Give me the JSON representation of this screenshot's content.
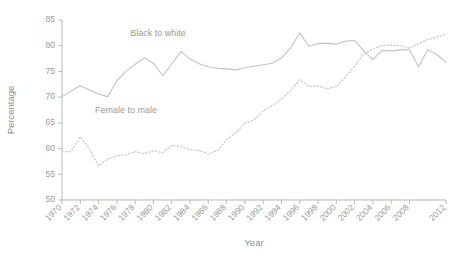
{
  "chart_data": {
    "type": "line",
    "title": "",
    "xlabel": "Year",
    "ylabel": "Percentage",
    "xlim": [
      1970,
      2012
    ],
    "ylim": [
      50,
      85
    ],
    "yticks": [
      50,
      55,
      60,
      65,
      70,
      75,
      80,
      85
    ],
    "xticks": [
      1970,
      1972,
      1974,
      1976,
      1978,
      1980,
      1982,
      1984,
      1986,
      1988,
      1990,
      1992,
      1994,
      1996,
      1998,
      2000,
      2002,
      2004,
      2006,
      2008,
      2012
    ],
    "xtick_labels": [
      "1970",
      "1972",
      "1974",
      "1976",
      "1978",
      "1980",
      "1982",
      "1984",
      "1986",
      "1988",
      "1990",
      "1992",
      "1994",
      "1996",
      "1998",
      "2000",
      "2002",
      "2004",
      "2006",
      "2008",
      "2012"
    ],
    "grid": false,
    "legend_position": "inline-annotation",
    "x": [
      1970,
      1971,
      1972,
      1973,
      1974,
      1975,
      1976,
      1977,
      1978,
      1979,
      1980,
      1981,
      1982,
      1983,
      1984,
      1985,
      1986,
      1987,
      1988,
      1989,
      1990,
      1991,
      1992,
      1993,
      1994,
      1995,
      1996,
      1997,
      1998,
      1999,
      2000,
      2001,
      2002,
      2003,
      2004,
      2005,
      2006,
      2007,
      2008,
      2009,
      2010,
      2011,
      2012
    ],
    "series": [
      {
        "name": "Black to white",
        "style": "solid",
        "color": "#c3c3c3",
        "label_x": 1980.5,
        "label_y": 81.8,
        "values": [
          70.1,
          71.2,
          72.2,
          71.4,
          70.6,
          70.1,
          73.2,
          75.0,
          76.4,
          77.6,
          76.6,
          74.2,
          76.4,
          78.9,
          77.4,
          76.5,
          75.9,
          75.6,
          75.5,
          75.3,
          75.7,
          76.0,
          76.3,
          76.6,
          77.6,
          79.6,
          82.5,
          79.9,
          80.4,
          80.5,
          80.3,
          80.9,
          81.0,
          79.0,
          77.3,
          79.1,
          79.0,
          79.2,
          79.2,
          75.9,
          79.2,
          78.3,
          76.8
        ]
      },
      {
        "name": "Female to male",
        "style": "dotted",
        "color": "#c9c9c9",
        "label_x": 1977.0,
        "label_y": 66.9,
        "values": [
          59.4,
          59.4,
          62.3,
          60.0,
          56.6,
          58.0,
          58.6,
          58.8,
          59.4,
          59.0,
          59.6,
          59.2,
          60.6,
          60.4,
          59.8,
          59.6,
          59.0,
          59.6,
          61.7,
          63.1,
          64.9,
          65.6,
          67.3,
          68.4,
          69.6,
          71.3,
          73.4,
          72.1,
          72.2,
          71.6,
          72.1,
          73.9,
          76.0,
          78.4,
          79.4,
          80.0,
          80.1,
          80.0,
          79.5,
          80.4,
          81.2,
          81.7,
          82.2
        ]
      }
    ]
  },
  "axis": {
    "y_title": "Percentage",
    "x_title": "Year"
  }
}
